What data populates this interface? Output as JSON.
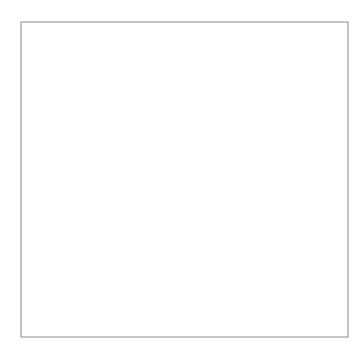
{
  "figure": {
    "background_color": "#ffffff",
    "frame": {
      "name": "diagram-frame",
      "x": 21,
      "y": 22,
      "width": 327,
      "height": 315,
      "stroke": "#8a8a8a",
      "stroke_width": 1
    },
    "thin_stroke": "#555555",
    "bold_stroke": "#1a1a1a",
    "point_fill": "#111111"
  },
  "centers": [
    {
      "id": "RM",
      "label": "RM",
      "label_x": 78,
      "label_y": 186,
      "cx": 96,
      "cy": 183,
      "family": "left",
      "description": "center of left circle family"
    },
    {
      "id": "A",
      "label": "A",
      "label_x": 290,
      "label_y": 188,
      "cx": 283,
      "cy": 185,
      "family": "right",
      "description": "center of right circle family"
    }
  ],
  "left_family": {
    "name": "left-circle-family",
    "cx": 96,
    "cy": 183,
    "radii": [
      20,
      41,
      63,
      85,
      107,
      129,
      151,
      173,
      196,
      219
    ],
    "count": 10
  },
  "right_family": {
    "name": "right-circle-family",
    "cx": 283,
    "cy": 185,
    "radii": [
      61,
      92,
      123,
      154,
      186
    ],
    "count": 5
  },
  "oval": {
    "name": "cartesian-oval",
    "stroke_width": 2.1,
    "points_x": [
      56,
      62,
      78,
      95,
      112,
      135,
      158,
      180,
      198,
      212,
      222
    ],
    "points_y_top": [
      161,
      147,
      131,
      123,
      118,
      118,
      122,
      128,
      135,
      156,
      186
    ],
    "description": "bold closed oval through C, D, E, F, G"
  },
  "points": [
    {
      "id": "C-upper",
      "label": "C",
      "x": 56,
      "y": 161,
      "label_x": 63,
      "label_y": 160
    },
    {
      "id": "C-lower",
      "label": "C",
      "x": 56,
      "y": 198,
      "label_x": 63,
      "label_y": 203
    },
    {
      "id": "D-upper",
      "label": "D",
      "x": 112,
      "y": 118,
      "label_x": 108,
      "label_y": 112
    },
    {
      "id": "D-lower",
      "label": "D",
      "x": 107,
      "y": 240,
      "label_x": 103,
      "label_y": 251
    },
    {
      "id": "E-upper",
      "label": "E",
      "x": 158,
      "y": 122,
      "label_x": 154,
      "label_y": 115
    },
    {
      "id": "E-lower",
      "label": "E",
      "x": 152,
      "y": 241,
      "label_x": 149,
      "label_y": 252
    },
    {
      "id": "F-upper",
      "label": "F",
      "x": 198,
      "y": 135,
      "label_x": 193,
      "label_y": 130
    },
    {
      "id": "F-lower",
      "label": "F",
      "x": 193,
      "y": 228,
      "label_x": 197,
      "label_y": 237
    },
    {
      "id": "G",
      "label": "G",
      "x": 222,
      "y": 186,
      "label_x": 212,
      "label_y": 186
    }
  ],
  "left_family_labels": [
    {
      "text": "1",
      "x": 114,
      "y": 178
    },
    {
      "text": "2",
      "x": 135,
      "y": 160
    },
    {
      "text": "3",
      "x": 158,
      "y": 158
    },
    {
      "text": "4",
      "x": 181,
      "y": 157
    },
    {
      "text": "5",
      "x": 205,
      "y": 139
    },
    {
      "text": "6",
      "x": 218,
      "y": 127
    },
    {
      "text": "7",
      "x": 238,
      "y": 119
    },
    {
      "text": "8",
      "x": 261,
      "y": 119
    },
    {
      "text": "4",
      "x": 175,
      "y": 312
    },
    {
      "text": "5",
      "x": 128,
      "y": 328
    }
  ],
  "right_family_labels": [
    {
      "text": "1",
      "x": 264,
      "y": 219
    },
    {
      "text": "2",
      "x": 232,
      "y": 253
    },
    {
      "text": "3",
      "x": 208,
      "y": 284
    }
  ]
}
